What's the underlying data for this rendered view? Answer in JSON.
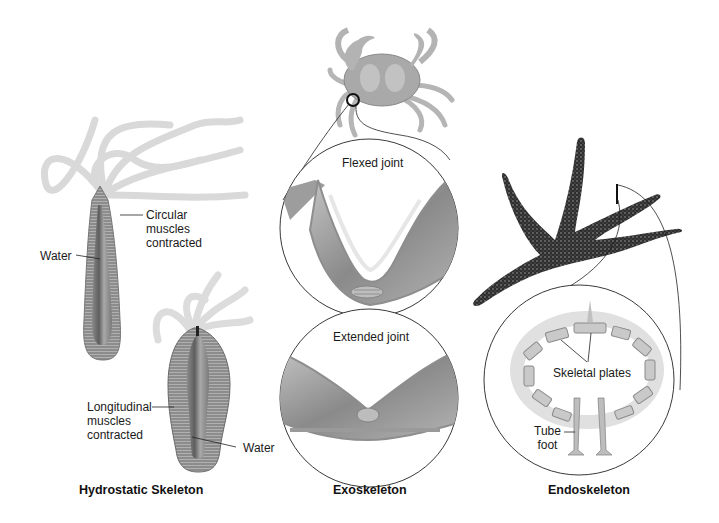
{
  "panels": [
    {
      "id": "hydrostatic",
      "caption": "Hydrostatic Skeleton",
      "labels": {
        "circular": [
          "Circular",
          "muscles",
          "contracted"
        ],
        "water_top": "Water",
        "longitudinal": [
          "Longitudinal",
          "muscles",
          "contracted"
        ],
        "water_bottom": "Water"
      }
    },
    {
      "id": "exoskeleton",
      "caption": "Exoskeleton",
      "labels": {
        "flexed": "Flexed joint",
        "extended": "Extended joint"
      }
    },
    {
      "id": "endoskeleton",
      "caption": "Endoskeleton",
      "labels": {
        "plates": "Skeletal plates",
        "tube_foot": [
          "Tube",
          "foot"
        ]
      }
    }
  ],
  "colors": {
    "tentacle": "#d8d8d8",
    "body_light": "#9a9a9a",
    "body_dark": "#5a5a5a",
    "crab": "#a8a8a8",
    "starfish": "#3a3a3a",
    "plate": "#c8c8c8",
    "line": "#222222"
  }
}
